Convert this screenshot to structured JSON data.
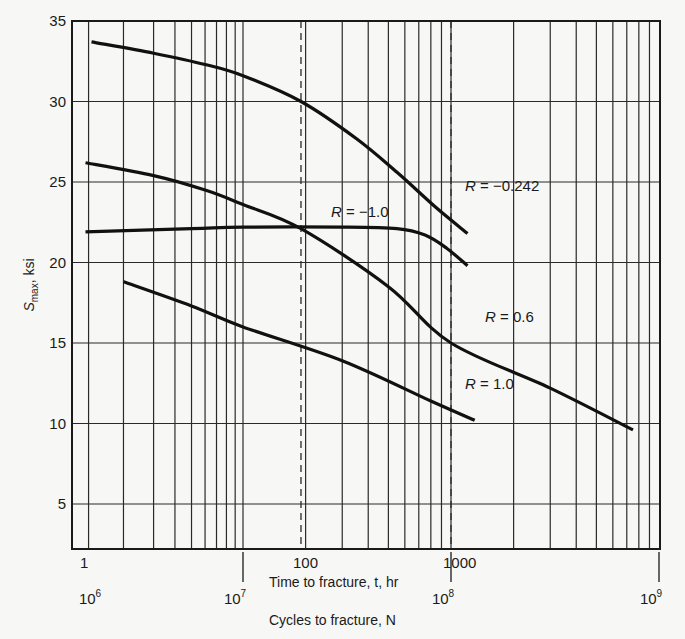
{
  "chart_data": {
    "type": "line",
    "title": "",
    "xlabel": "Cycles to fracture, N",
    "xlabel_secondary": "Time to fracture, t, hr",
    "ylabel": "S_max, ksi",
    "ylabel_main": "S",
    "ylabel_sub": "max",
    "ylabel_unit": ", ksi",
    "x_scale": "log",
    "xlim": [
      1000000,
      1000000000
    ],
    "ylim": [
      2.2,
      35
    ],
    "grid": true,
    "y_ticks": [
      5,
      10,
      15,
      20,
      25,
      30,
      35
    ],
    "y_tick_labels": [
      "5",
      "10",
      "15",
      "20",
      "25",
      "30",
      "35"
    ],
    "x_ticks": [
      1000000,
      10000000,
      100000000,
      1000000000
    ],
    "x_tick_labels": [
      {
        "base": "10",
        "exp": "6"
      },
      {
        "base": "10",
        "exp": "7"
      },
      {
        "base": "10",
        "exp": "8"
      },
      {
        "base": "10",
        "exp": "9"
      }
    ],
    "time_tick_labels": [
      {
        "label": "1",
        "N": 1000000
      },
      {
        "label": "100",
        "N": 19000000
      },
      {
        "label": "1000",
        "N": 100000000
      }
    ],
    "dashed_reference_lines": [
      {
        "time_hr": 100,
        "N": 19000000
      },
      {
        "time_hr": 1000,
        "N": 100000000
      }
    ],
    "series": [
      {
        "name": "R = −0.242",
        "label_R": "R",
        "label_value": " = −0.242",
        "points": [
          [
            1300000,
            33.7
          ],
          [
            3000000,
            33.0
          ],
          [
            6000000,
            32.3
          ],
          [
            10000000,
            31.6
          ],
          [
            19000000,
            30.0
          ],
          [
            35000000,
            27.7
          ],
          [
            55000000,
            25.6
          ],
          [
            85000000,
            23.4
          ],
          [
            120000000,
            21.8
          ]
        ]
      },
      {
        "name": "R = −1.0",
        "label_R": "R",
        "label_value": " = −1.0",
        "points": [
          [
            1200000,
            21.9
          ],
          [
            5000000,
            22.1
          ],
          [
            10000000,
            22.2
          ],
          [
            30000000,
            22.2
          ],
          [
            55000000,
            22.1
          ],
          [
            75000000,
            21.7
          ],
          [
            95000000,
            20.9
          ],
          [
            120000000,
            19.8
          ]
        ]
      },
      {
        "name": "R = 0.6",
        "label_R": "R",
        "label_value": " = 0.6",
        "points": [
          [
            1200000,
            26.2
          ],
          [
            3000000,
            25.4
          ],
          [
            6000000,
            24.5
          ],
          [
            10000000,
            23.6
          ],
          [
            19000000,
            22.1
          ],
          [
            50000000,
            18.5
          ],
          [
            100000000,
            15.0
          ],
          [
            300000000,
            12.2
          ],
          [
            750000000,
            9.6
          ]
        ]
      },
      {
        "name": "R = 1.0",
        "label_R": "R",
        "label_value": " = 1.0",
        "points": [
          [
            2000000,
            18.8
          ],
          [
            5000000,
            17.3
          ],
          [
            10000000,
            16.0
          ],
          [
            30000000,
            13.9
          ],
          [
            80000000,
            11.4
          ],
          [
            130000000,
            10.2
          ]
        ]
      }
    ],
    "label_positions": {
      "R = −0.242": [
        465,
        191
      ],
      "R = −1.0": [
        331,
        217
      ],
      "R = 0.6": [
        485,
        322
      ],
      "R = 1.0": [
        465,
        389
      ]
    }
  }
}
